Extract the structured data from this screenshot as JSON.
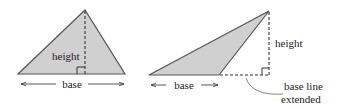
{
  "diagram": {
    "colors": {
      "fill": "#d0d0d0",
      "stroke": "#555555",
      "dash": "#333333",
      "text": "#222222"
    },
    "left_triangle": {
      "height_label": "height",
      "base_label": "base"
    },
    "right_triangle": {
      "height_label": "height",
      "base_label": "base",
      "annotation_line1": "base line",
      "annotation_line2": "extended"
    }
  }
}
